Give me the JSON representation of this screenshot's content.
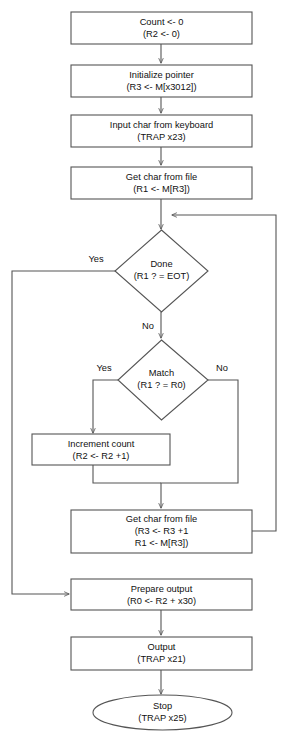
{
  "diagram": {
    "background_color": "#ffffff",
    "line_color": "#555555",
    "text_color": "#111111",
    "nodes": [
      {
        "id": "count",
        "name": "process-count-init",
        "shape": "rect",
        "line1": "Count <- 0",
        "line2": "(R2 <- 0)"
      },
      {
        "id": "init_ptr",
        "name": "process-initialize-pointer",
        "shape": "rect",
        "line1": "Initialize pointer",
        "line2": "(R3 <- M[x3012])"
      },
      {
        "id": "input_char",
        "name": "process-input-char",
        "shape": "rect",
        "line1": "Input char from keyboard",
        "line2": "(TRAP x23)"
      },
      {
        "id": "get_char_1",
        "name": "process-get-char-from-file",
        "shape": "rect",
        "line1": "Get char from file",
        "line2": "(R1 <- M[R3])"
      },
      {
        "id": "done",
        "name": "decision-done",
        "shape": "diamond",
        "line1": "Done",
        "line2": "(R1 ? = EOT)"
      },
      {
        "id": "match",
        "name": "decision-match",
        "shape": "diamond",
        "line1": "Match",
        "line2": "(R1 ? = R0)"
      },
      {
        "id": "increment",
        "name": "process-increment-count",
        "shape": "rect",
        "line1": "Increment count",
        "line2": "(R2 <- R2 +1)"
      },
      {
        "id": "get_char_2",
        "name": "process-get-next-char-from-file",
        "shape": "rect",
        "line1": "Get char from file",
        "line2": "(R3 <- R3 +1",
        "line3": "R1 <- M[R3])"
      },
      {
        "id": "prepare",
        "name": "process-prepare-output",
        "shape": "rect",
        "line1": "Prepare output",
        "line2": "(R0 <- R2 + x30)"
      },
      {
        "id": "output",
        "name": "process-output",
        "shape": "rect",
        "line1": "Output",
        "line2": "(TRAP x21)"
      },
      {
        "id": "stop",
        "name": "terminator-stop",
        "shape": "ellipse",
        "line1": "Stop",
        "line2": "(TRAP x25)"
      }
    ],
    "edge_labels": {
      "done_yes": "Yes",
      "done_no": "No",
      "match_yes": "Yes",
      "match_no": "No"
    }
  }
}
